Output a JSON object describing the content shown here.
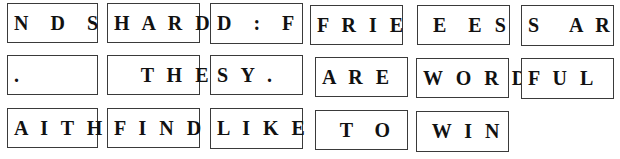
{
  "rows": [
    {
      "tiles": [
        {
          "text": "N  D  S"
        },
        {
          "text": "H A R D"
        },
        {
          "text": "D  :  F"
        },
        {
          "text": "F R I E"
        },
        {
          "text": " E  E S"
        },
        {
          "text": "S   A R"
        }
      ]
    },
    {
      "tiles": [
        {
          "text": "."
        },
        {
          "text": "   T H E"
        },
        {
          "text": "S Y ."
        },
        {
          "text": "A R E"
        },
        {
          "text": "W O R D"
        },
        {
          "text": "F U L"
        }
      ]
    },
    {
      "tiles": [
        {
          "text": "A I T H"
        },
        {
          "text": "F I N D"
        },
        {
          "text": "L I K E"
        },
        {
          "text": "  T  O"
        },
        {
          "text": " W I N"
        }
      ]
    }
  ]
}
